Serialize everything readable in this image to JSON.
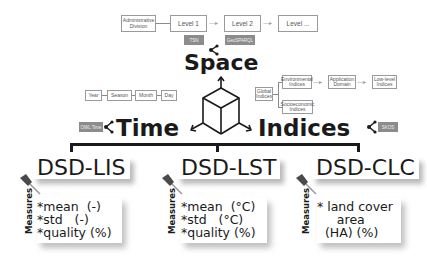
{
  "space": {
    "title": "Space",
    "hierarchy": [
      "Administrative Division",
      "Level 1",
      "Level 2",
      "Level ..."
    ],
    "tags": [
      "TSN",
      "GeoSPARQL"
    ]
  },
  "time": {
    "title": "Time",
    "hierarchy": [
      "Year",
      "Season",
      "Month",
      "Day"
    ],
    "tag": "OWL Time"
  },
  "indices": {
    "title": "Indices",
    "root": "Global Indices",
    "branch1": [
      "Environmental Indices",
      "Application Domain",
      "Low-level Indices"
    ],
    "branch2": "Socioeconomic Indices",
    "tag": "SKOS"
  },
  "datasets": [
    {
      "title": "DSD-LIS",
      "label": "Measures",
      "measures": "*mean  (-)\n*std   (-)\n*quality (%)"
    },
    {
      "title": "DSD-LST",
      "label": "Measures",
      "measures": "*mean  (°C)\n*std   (°C)\n*quality (%)"
    },
    {
      "title": "DSD-CLC",
      "label": "Measures",
      "measures": "* land cover\n     area\n  (HA) (%)"
    }
  ],
  "colors": {
    "tag_bg": "#8c8c8c",
    "box_border": "#9a9a9a",
    "text": "#1a1a1a"
  }
}
